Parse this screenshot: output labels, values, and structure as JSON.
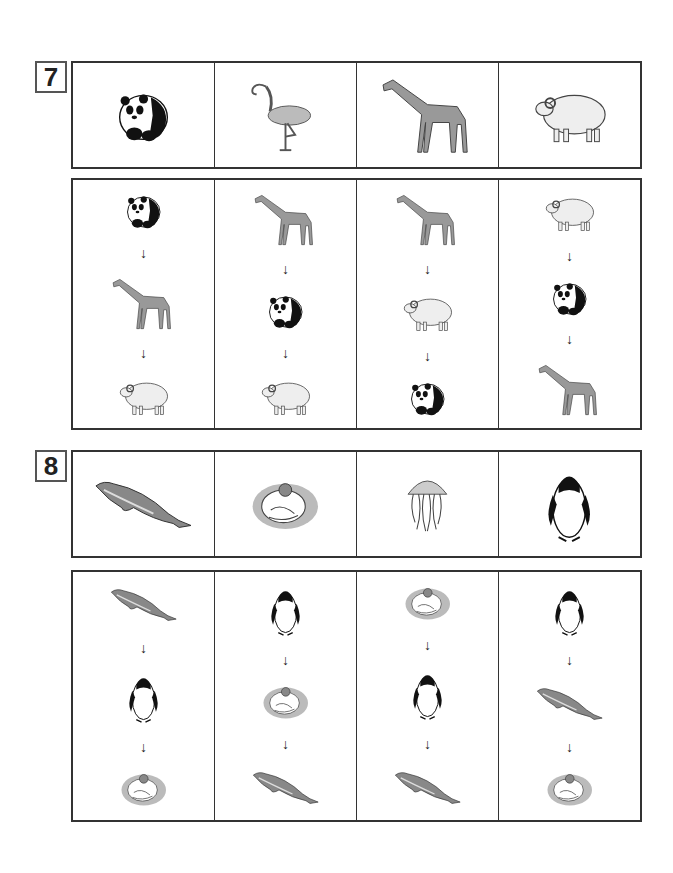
{
  "questions": [
    {
      "number": "7",
      "options": [
        "panda",
        "flamingo",
        "giraffe",
        "sheep"
      ],
      "sequences": [
        [
          "panda",
          "giraffe",
          "sheep"
        ],
        [
          "giraffe",
          "panda",
          "sheep"
        ],
        [
          "giraffe",
          "sheep",
          "panda"
        ],
        [
          "sheep",
          "panda",
          "giraffe"
        ]
      ]
    },
    {
      "number": "8",
      "options": [
        "dolphin",
        "sea-otter",
        "jellyfish",
        "penguin"
      ],
      "sequences": [
        [
          "dolphin",
          "penguin",
          "sea-otter"
        ],
        [
          "penguin",
          "sea-otter",
          "dolphin"
        ],
        [
          "sea-otter",
          "penguin",
          "dolphin"
        ],
        [
          "penguin",
          "dolphin",
          "sea-otter"
        ]
      ]
    }
  ],
  "arrow_glyph": "↓"
}
